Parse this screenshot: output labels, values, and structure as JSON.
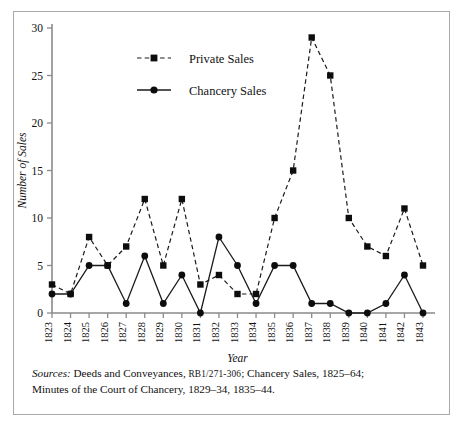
{
  "figure": {
    "y_axis_title": "Number of Sales",
    "x_axis_title": "Year",
    "legend": [
      {
        "label": "Private Sales",
        "marker": "square",
        "line": "dashed"
      },
      {
        "label": "Chancery Sales",
        "marker": "circle",
        "line": "solid"
      }
    ],
    "source_note": {
      "lead_word": "Sources:",
      "line1_rest": " Deeds and Conveyances, RB1/271-306; Chancery Sales, 1825–64;",
      "line1_part_a": " Deeds and Conveyances, ",
      "line1_smallcaps": "RB1/271-306",
      "line1_part_b": "; Chancery Sales, 1825–64;",
      "line2": "Minutes of the Court of Chancery, 1829–34, 1835–44."
    }
  },
  "chart_data": {
    "type": "line",
    "title": "",
    "xlabel": "Year",
    "ylabel": "Number of Sales",
    "x": [
      1823,
      1824,
      1825,
      1826,
      1827,
      1828,
      1829,
      1830,
      1831,
      1832,
      1833,
      1834,
      1835,
      1836,
      1837,
      1838,
      1839,
      1840,
      1841,
      1842,
      1843
    ],
    "categories": [
      "1823",
      "1824",
      "1825",
      "1826",
      "1827",
      "1828",
      "1829",
      "1830",
      "1831",
      "1832",
      "1833",
      "1834",
      "1835",
      "1836",
      "1837",
      "1838",
      "1839",
      "1840",
      "1841",
      "1842",
      "1843"
    ],
    "series": [
      {
        "name": "Private Sales",
        "marker": "square",
        "linestyle": "dashed",
        "color": "#0d0d0d",
        "values": [
          3,
          2,
          8,
          5,
          7,
          12,
          5,
          12,
          3,
          4,
          2,
          2,
          10,
          15,
          29,
          25,
          10,
          7,
          6,
          11,
          5
        ]
      },
      {
        "name": "Chancery Sales",
        "marker": "circle",
        "linestyle": "solid",
        "color": "#0d0d0d",
        "values": [
          2,
          2,
          5,
          5,
          1,
          6,
          1,
          4,
          0,
          8,
          5,
          1,
          5,
          5,
          1,
          1,
          0,
          0,
          1,
          4,
          0
        ]
      }
    ],
    "ylim": [
      0,
      30
    ],
    "yticks": [
      0,
      5,
      10,
      15,
      20,
      25,
      30
    ],
    "ytick_labels": [
      "0",
      "5",
      "10",
      "15",
      "20",
      "25",
      "30"
    ],
    "grid": false,
    "legend_position": "upper-left-inset"
  }
}
